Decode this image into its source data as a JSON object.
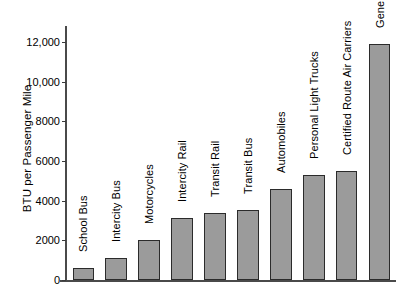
{
  "chart_data": {
    "type": "bar",
    "title": "",
    "xlabel": "",
    "ylabel": "BTU per Passenger Mile",
    "ylim": [
      0,
      12800
    ],
    "grid": false,
    "legend": "none",
    "orientation": "vertical",
    "bar_color": "#9b9b9b",
    "bar_edge_color": "#2b2b2b",
    "axis_color": "#4a4a4a",
    "ytick_labels": [
      "0",
      "2000",
      "4000",
      "6000",
      "8000",
      "10,000",
      "12,000"
    ],
    "ytick_values": [
      0,
      2000,
      4000,
      6000,
      8000,
      10000,
      12000
    ],
    "categories": [
      "School Bus",
      "Intercity Bus",
      "Motorcycles",
      "Intercity Rail",
      "Transit Rail",
      "Transit Bus",
      "Automobiles",
      "Personal Light Trucks",
      "Certified Route Air Carriers",
      "General Aviation"
    ],
    "values": [
      600,
      1100,
      2000,
      3100,
      3400,
      3550,
      4600,
      5300,
      5500,
      11900
    ]
  }
}
